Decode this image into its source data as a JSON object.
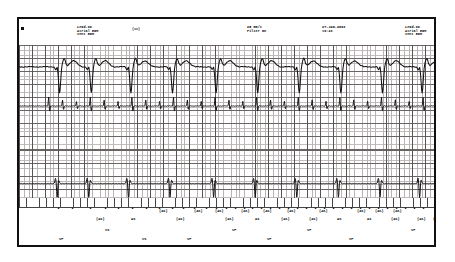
{
  "device_report": {
    "title": "Implantable device stored electrogram strip",
    "edge_marker": "■",
    "header_blocks": [
      {
        "name": "left-lead-label",
        "x": 58,
        "lines": [
          "Lead-II",
          "Atrial EGM",
          "Vent EGM"
        ]
      },
      {
        "name": "sweep-filter-label",
        "x": 228,
        "lines": [
          "25 mm/s",
          "Filter On"
        ]
      },
      {
        "name": "datetime-label",
        "x": 303,
        "lines": [
          "27-JAN-2003",
          "16:23"
        ]
      },
      {
        "name": "right-lead-label",
        "x": 386,
        "lines": [
          "Lead-II",
          "Atrial EGM",
          "Vent EGM"
        ]
      }
    ],
    "paren_labels": [
      {
        "name": "paren-1s-scale",
        "x": 113,
        "text": "(1s)"
      },
      {
        "name": "paren-right-edge",
        "x": 439,
        "text": "("
      }
    ],
    "channels": [
      {
        "name": "surface-ecg-lead-ii",
        "label": "Lead-II"
      },
      {
        "name": "atrial-egm",
        "label": "Atrial EGM"
      },
      {
        "name": "ventricular-egm",
        "label": "Vent EGM"
      }
    ],
    "settings": {
      "paper_speed": "25 mm/s",
      "filter": "Filter On",
      "date": "27-JAN-2003",
      "time": "16:23",
      "lead": "Lead-II"
    },
    "markers": {
      "atrial_sense_bracket": "(AS)",
      "atrial_sense": "AS",
      "vent_pace": "VP",
      "vent_sense": "VS",
      "tick": "•"
    },
    "annotation_ticks": [
      38,
      52,
      70,
      85,
      98,
      112,
      126,
      139,
      152,
      163,
      174,
      186,
      196,
      206,
      215,
      224,
      232,
      241,
      250,
      259,
      268,
      277,
      286,
      295,
      304,
      313,
      322,
      331,
      340,
      349,
      358,
      367,
      376,
      385,
      394,
      403
    ],
    "atrial_markers_upper": [
      {
        "x": 140,
        "text": "(AS)"
      },
      {
        "x": 175,
        "text": "(AS)"
      },
      {
        "x": 196,
        "text": "(AS)"
      },
      {
        "x": 222,
        "text": "(AS)"
      },
      {
        "x": 244,
        "text": "(AS)"
      },
      {
        "x": 268,
        "text": "(AS)"
      },
      {
        "x": 300,
        "text": "(AS)"
      },
      {
        "x": 338,
        "text": "(AS)"
      },
      {
        "x": 356,
        "text": "(AS)"
      },
      {
        "x": 374,
        "text": "(AS)"
      }
    ],
    "atrial_markers_lower": [
      {
        "x": 77,
        "text": "(AS)"
      },
      {
        "x": 112,
        "text": "AS"
      },
      {
        "x": 157,
        "text": "(AS)"
      },
      {
        "x": 206,
        "text": "(AS)"
      },
      {
        "x": 236,
        "text": "AS"
      },
      {
        "x": 262,
        "text": "(AS)"
      },
      {
        "x": 290,
        "text": "(AS)"
      },
      {
        "x": 318,
        "text": "AS"
      },
      {
        "x": 348,
        "text": "AS"
      },
      {
        "x": 372,
        "text": "(AS)"
      },
      {
        "x": 398,
        "text": "(AS)"
      },
      {
        "x": 414,
        "text": "("
      }
    ],
    "vent_markers_upper": [
      {
        "x": 86,
        "text": "VS"
      },
      {
        "x": 213,
        "text": "VP"
      },
      {
        "x": 288,
        "text": "VP"
      },
      {
        "x": 392,
        "text": "VP"
      }
    ],
    "vent_markers_lower": [
      {
        "x": 40,
        "text": "VP"
      },
      {
        "x": 123,
        "text": "VS"
      },
      {
        "x": 168,
        "text": "VP"
      },
      {
        "x": 248,
        "text": "VP"
      },
      {
        "x": 330,
        "text": "VP"
      }
    ],
    "chart_data": {
      "type": "line",
      "title": "Three-channel intracardiac electrogram strip",
      "xlabel": "Time",
      "ylabel": "Amplitude",
      "grid": true,
      "legend": "none",
      "series": [
        {
          "name": "Lead-II surface ECG",
          "description": "Paced ventricular rhythm: wide QRS complexes with deep negative deflections and broad T waves",
          "beat_x": [
            38,
            70,
            110,
            152,
            196,
            238,
            280,
            322,
            364,
            404
          ],
          "qrs_amplitude": [
            -0.9,
            -0.9,
            -0.85,
            -0.9,
            -0.9,
            -0.88,
            -0.9,
            -0.9,
            -0.85,
            -0.9
          ]
        },
        {
          "name": "Atrial EGM",
          "description": "Rapid irregular low-amplitude atrial deflections consistent with sensed atrial activity",
          "event_x": [
            30,
            44,
            58,
            72,
            86,
            100,
            114,
            128,
            142,
            156,
            170,
            184,
            198,
            212,
            226,
            240,
            254,
            268,
            282,
            296,
            310,
            324,
            338,
            352,
            366,
            380,
            394,
            408
          ]
        },
        {
          "name": "Ventricular EGM",
          "description": "Large biphasic ventricular electrograms time-aligned with the surface QRS complexes",
          "event_x": [
            38,
            70,
            110,
            152,
            196,
            238,
            280,
            322,
            364,
            404
          ],
          "amplitude": [
            -1.0,
            -1.0,
            -1.0,
            -1.0,
            -1.0,
            -1.0,
            -1.0,
            -1.0,
            -1.0,
            -1.0
          ]
        }
      ]
    }
  }
}
